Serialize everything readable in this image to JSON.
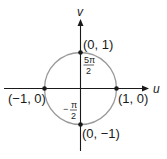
{
  "diagram": {
    "type": "unit-circle-uv-plane",
    "axes": {
      "horizontal_label": "u",
      "vertical_label": "v"
    },
    "points": [
      {
        "label": "(0, 1)",
        "u": 0,
        "v": 1
      },
      {
        "label": "(1, 0)",
        "u": 1,
        "v": 0
      },
      {
        "label": "(0, −1)",
        "u": 0,
        "v": -1
      },
      {
        "label": "(−1, 0)",
        "u": -1,
        "v": 0
      }
    ],
    "angle_labels": {
      "top": {
        "numerator": "5π",
        "denominator": "2"
      },
      "bottom": {
        "sign": "−",
        "numerator": "π",
        "denominator": "2"
      }
    },
    "colors": {
      "axis": "#1a1a1a",
      "circle": "#9a9a9a",
      "point": "#1a1a1a"
    }
  }
}
